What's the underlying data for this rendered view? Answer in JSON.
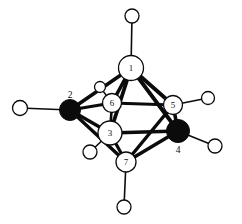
{
  "figure": {
    "type": "molecular-cluster-diagram",
    "title": "",
    "caption": "",
    "background_color": "#ffffff",
    "line_color": "#0b0b0b",
    "open_vertex_fill": "#ffffff",
    "filled_vertex_fill": "#0b0b0b",
    "width": 242,
    "height": 224
  },
  "chart_data": {
    "type": "diagram",
    "title": "",
    "vertices": [
      {
        "id": "1",
        "label": "1",
        "x": 131,
        "y": 68,
        "r": 12.5,
        "style": "open",
        "label_x": 131,
        "label_y": 68,
        "label_inside": true
      },
      {
        "id": "2",
        "label": "2",
        "x": 70,
        "y": 110,
        "r": 10.5,
        "style": "filled",
        "label_x": 70,
        "label_y": 95,
        "label_inside": false
      },
      {
        "id": "3",
        "label": "3",
        "x": 110,
        "y": 133,
        "r": 12.0,
        "style": "open",
        "label_x": 110,
        "label_y": 133,
        "label_inside": true
      },
      {
        "id": "4",
        "label": "4",
        "x": 178,
        "y": 131,
        "r": 11.5,
        "style": "filled",
        "label_x": 178,
        "label_y": 150,
        "label_inside": false
      },
      {
        "id": "5",
        "label": "5",
        "x": 173,
        "y": 105,
        "r": 9.5,
        "style": "open",
        "label_x": 173,
        "label_y": 105,
        "label_inside": true
      },
      {
        "id": "6",
        "label": "6",
        "x": 112,
        "y": 103,
        "r": 9.5,
        "style": "open",
        "label_x": 112,
        "label_y": 103,
        "label_inside": true
      },
      {
        "id": "7",
        "label": "7",
        "x": 126,
        "y": 162,
        "r": 10.0,
        "style": "open",
        "label_x": 126,
        "label_y": 162,
        "label_inside": true
      }
    ],
    "terminal_atoms": [
      {
        "id": "h1",
        "label": "",
        "x": 132,
        "y": 16,
        "r": 7.0,
        "style": "open",
        "bonded_to": "1"
      },
      {
        "id": "h2",
        "label": "",
        "x": 20,
        "y": 108,
        "r": 7.5,
        "style": "open",
        "bonded_to": "2"
      },
      {
        "id": "h3",
        "label": "",
        "x": 90,
        "y": 152,
        "r": 7.0,
        "style": "open",
        "bonded_to": "3"
      },
      {
        "id": "h4",
        "label": "",
        "x": 215,
        "y": 146,
        "r": 7.0,
        "style": "open",
        "bonded_to": "4"
      },
      {
        "id": "h5",
        "label": "",
        "x": 208,
        "y": 98,
        "r": 6.5,
        "style": "open",
        "bonded_to": "5"
      },
      {
        "id": "h6",
        "label": "",
        "x": 100,
        "y": 87,
        "r": 5.5,
        "style": "open",
        "bonded_to": "6"
      },
      {
        "id": "h7",
        "label": "",
        "x": 124,
        "y": 207,
        "r": 7.0,
        "style": "open",
        "bonded_to": "7"
      }
    ],
    "cluster_bonds": [
      {
        "from": "1",
        "to": "2",
        "width": 3.6
      },
      {
        "from": "1",
        "to": "6",
        "width": 3.6
      },
      {
        "from": "1",
        "to": "3",
        "width": 3.8
      },
      {
        "from": "1",
        "to": "5",
        "width": 3.8
      },
      {
        "from": "1",
        "to": "4",
        "width": 3.8
      },
      {
        "from": "2",
        "to": "6",
        "width": 3.0
      },
      {
        "from": "2",
        "to": "3",
        "width": 3.4
      },
      {
        "from": "2",
        "to": "7",
        "width": 3.4
      },
      {
        "from": "3",
        "to": "6",
        "width": 2.6
      },
      {
        "from": "3",
        "to": "7",
        "width": 3.2
      },
      {
        "from": "3",
        "to": "4",
        "width": 3.6
      },
      {
        "from": "6",
        "to": "5",
        "width": 2.8
      },
      {
        "from": "5",
        "to": "4",
        "width": 3.6
      },
      {
        "from": "5",
        "to": "7",
        "width": 3.4
      },
      {
        "from": "4",
        "to": "7",
        "width": 3.6
      }
    ],
    "terminal_bonds": [
      {
        "from": "1",
        "to": "h1",
        "width": 1.6
      },
      {
        "from": "2",
        "to": "h2",
        "width": 1.6
      },
      {
        "from": "3",
        "to": "h3",
        "width": 1.6
      },
      {
        "from": "4",
        "to": "h4",
        "width": 1.6
      },
      {
        "from": "5",
        "to": "h5",
        "width": 1.6
      },
      {
        "from": "6",
        "to": "h6",
        "width": 1.4
      },
      {
        "from": "7",
        "to": "h7",
        "width": 1.6
      }
    ]
  }
}
